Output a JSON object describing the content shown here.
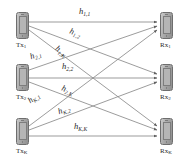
{
  "figure": {
    "type": "diagram",
    "line_color": "#8a8a8a",
    "label_color": "#1e1e1e",
    "device_color": "#a8a8a8",
    "background": "#ffffff"
  },
  "transmitters": [
    {
      "id": "tx1",
      "label": "Tx",
      "sub": "1",
      "icon": "mobile-phone-icon"
    },
    {
      "id": "tx2",
      "label": "Tx",
      "sub": "2",
      "icon": "mobile-phone-icon"
    },
    {
      "id": "txK",
      "label": "Tx",
      "sub": "K",
      "icon": "mobile-phone-icon"
    }
  ],
  "receivers": [
    {
      "id": "rx1",
      "label": "Rx",
      "sub": "1",
      "icon": "mobile-phone-icon"
    },
    {
      "id": "rx2",
      "label": "Rx",
      "sub": "2",
      "icon": "mobile-phone-icon"
    },
    {
      "id": "rxK",
      "label": "Rx",
      "sub": "K",
      "icon": "mobile-phone-icon"
    }
  ],
  "channels": [
    {
      "id": "h11",
      "symbol": "h",
      "sub": "1,1",
      "from": "tx1",
      "to": "rx1"
    },
    {
      "id": "h12",
      "symbol": "h",
      "sub": "1,2",
      "from": "tx1",
      "to": "rx2"
    },
    {
      "id": "h1K",
      "symbol": "h",
      "sub": "1,K",
      "from": "tx1",
      "to": "rxK"
    },
    {
      "id": "h21",
      "symbol": "h",
      "sub": "2,1",
      "from": "tx2",
      "to": "rx1"
    },
    {
      "id": "h22",
      "symbol": "h",
      "sub": "2,2",
      "from": "tx2",
      "to": "rx2"
    },
    {
      "id": "h2K",
      "symbol": "h",
      "sub": "2,K",
      "from": "tx2",
      "to": "rxK"
    },
    {
      "id": "hK1",
      "symbol": "h",
      "sub": "K,1",
      "from": "txK",
      "to": "rx1"
    },
    {
      "id": "hK2",
      "symbol": "h",
      "sub": "K,2",
      "from": "txK",
      "to": "rx2"
    },
    {
      "id": "hKK",
      "symbol": "h",
      "sub": "K,K",
      "from": "txK",
      "to": "rxK"
    }
  ]
}
